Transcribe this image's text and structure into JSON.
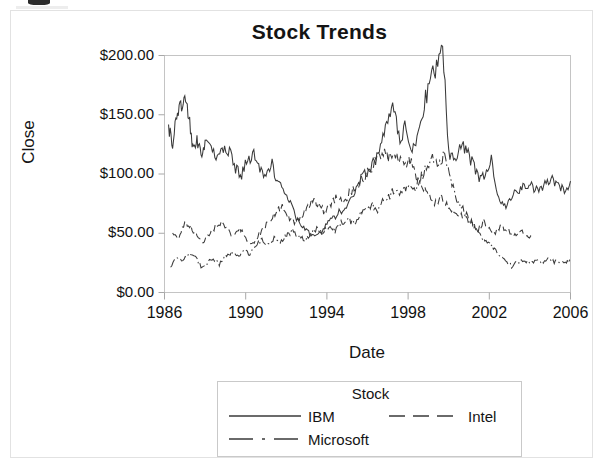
{
  "chart_data": {
    "type": "line",
    "title": "Stock Trends",
    "xlabel": "Date",
    "ylabel": "Close",
    "xlim": [
      1986,
      2006
    ],
    "ylim": [
      0,
      200
    ],
    "xticks": [
      "1986",
      "1990",
      "1994",
      "1998",
      "2002",
      "2006"
    ],
    "xtick_values": [
      1986,
      1990,
      1994,
      1998,
      2002,
      2006
    ],
    "yticks": [
      "$0.00",
      "$50.00",
      "$100.00",
      "$150.00",
      "$200.00"
    ],
    "ytick_values": [
      0,
      50,
      100,
      150,
      200
    ],
    "grid": false,
    "legend_position": "below",
    "legend_title": "Stock",
    "series": [
      {
        "name": "IBM",
        "linestyle": "solid",
        "color": "#3a3a3a",
        "x": [
          1986.2,
          1986.4,
          1986.6,
          1986.8,
          1987.0,
          1987.2,
          1987.4,
          1987.6,
          1987.8,
          1988.0,
          1988.3,
          1988.6,
          1988.9,
          1989.2,
          1989.5,
          1989.8,
          1990.1,
          1990.4,
          1990.7,
          1991.0,
          1991.3,
          1991.6,
          1991.9,
          1992.2,
          1992.5,
          1992.8,
          1993.1,
          1993.4,
          1993.7,
          1994.0,
          1994.3,
          1994.6,
          1994.9,
          1995.2,
          1995.5,
          1995.8,
          1996.1,
          1996.4,
          1996.7,
          1997.0,
          1997.3,
          1997.6,
          1997.9,
          1998.2,
          1998.5,
          1998.8,
          1999.1,
          1999.4,
          1999.7,
          2000.0,
          2000.3,
          2000.6,
          2000.9,
          2001.2,
          2001.5,
          2001.8,
          2002.1,
          2002.4,
          2002.7,
          2003.0,
          2003.3,
          2003.6,
          2003.9,
          2004.2,
          2004.5,
          2004.8,
          2005.1,
          2005.4,
          2005.7,
          2006.0
        ],
        "y": [
          141,
          125,
          150,
          158,
          165,
          148,
          120,
          128,
          118,
          125,
          120,
          112,
          120,
          118,
          105,
          100,
          112,
          118,
          105,
          98,
          108,
          92,
          88,
          75,
          62,
          55,
          50,
          48,
          52,
          58,
          62,
          68,
          72,
          78,
          92,
          98,
          105,
          112,
          125,
          148,
          155,
          130,
          142,
          120,
          135,
          160,
          178,
          192,
          210,
          118,
          112,
          125,
          118,
          108,
          95,
          100,
          112,
          82,
          72,
          78,
          85,
          88,
          92,
          88,
          85,
          92,
          95,
          90,
          86,
          94
        ]
      },
      {
        "name": "Intel",
        "linestyle": "dashed",
        "color": "#3a3a3a",
        "x": [
          1986.4,
          1986.7,
          1987.0,
          1987.3,
          1987.6,
          1987.9,
          1988.2,
          1988.5,
          1988.8,
          1989.1,
          1989.4,
          1989.7,
          1990.0,
          1990.3,
          1990.6,
          1990.9,
          1991.2,
          1991.5,
          1991.8,
          1992.1,
          1992.4,
          1992.7,
          1993.0,
          1993.3,
          1993.6,
          1993.9,
          1994.2,
          1994.5,
          1994.8,
          1995.1,
          1995.4,
          1995.7,
          1996.0,
          1996.3,
          1996.6,
          1996.9,
          1997.2,
          1997.5,
          1997.8,
          1998.1,
          1998.4,
          1998.7,
          1999.0,
          1999.3,
          1999.6,
          1999.9,
          2000.2,
          2000.5,
          2000.8,
          2001.1,
          2001.4,
          2001.7,
          2002.0,
          2002.3,
          2002.6,
          2002.9,
          2003.2,
          2003.5,
          2003.8,
          2004.1
        ],
        "y": [
          52,
          45,
          58,
          55,
          48,
          42,
          50,
          55,
          58,
          52,
          48,
          55,
          45,
          40,
          48,
          55,
          60,
          68,
          72,
          65,
          58,
          62,
          70,
          78,
          74,
          68,
          75,
          80,
          76,
          84,
          88,
          95,
          100,
          108,
          115,
          118,
          110,
          116,
          108,
          112,
          95,
          88,
          82,
          76,
          80,
          74,
          70,
          66,
          62,
          58,
          52,
          60,
          55,
          50,
          56,
          52,
          48,
          52,
          48,
          45
        ]
      },
      {
        "name": "Microsoft",
        "linestyle": "dashdot",
        "color": "#3a3a3a",
        "x": [
          1986.3,
          1986.6,
          1986.9,
          1987.2,
          1987.5,
          1987.8,
          1988.1,
          1988.4,
          1988.7,
          1989.0,
          1989.3,
          1989.6,
          1989.9,
          1990.2,
          1990.5,
          1990.8,
          1991.1,
          1991.4,
          1991.7,
          1992.0,
          1992.3,
          1992.6,
          1992.9,
          1993.2,
          1993.5,
          1993.8,
          1994.1,
          1994.4,
          1994.7,
          1995.0,
          1995.3,
          1995.6,
          1995.9,
          1996.2,
          1996.5,
          1996.8,
          1997.1,
          1997.4,
          1997.7,
          1998.0,
          1998.3,
          1998.6,
          1998.9,
          1999.2,
          1999.5,
          1999.8,
          2000.1,
          2000.4,
          2000.7,
          2001.0,
          2001.3,
          2001.6,
          2001.9,
          2002.2,
          2002.5,
          2002.8,
          2003.1,
          2003.4,
          2003.7,
          2004.0,
          2004.3,
          2004.6,
          2004.9,
          2005.2,
          2005.5,
          2005.8,
          2006.0
        ],
        "y": [
          22,
          30,
          26,
          34,
          30,
          22,
          25,
          28,
          24,
          30,
          34,
          30,
          36,
          32,
          40,
          44,
          40,
          46,
          42,
          48,
          52,
          48,
          44,
          50,
          54,
          50,
          56,
          52,
          58,
          62,
          58,
          66,
          70,
          74,
          70,
          78,
          82,
          88,
          84,
          92,
          88,
          96,
          104,
          112,
          108,
          116,
          95,
          78,
          70,
          62,
          55,
          48,
          42,
          38,
          32,
          28,
          22,
          26,
          28,
          24,
          27,
          25,
          28,
          26,
          27,
          26,
          27
        ]
      }
    ]
  }
}
